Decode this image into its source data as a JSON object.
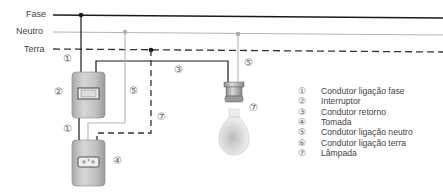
{
  "lines": {
    "fase": {
      "label": "Fase",
      "color": "#1a1a1a",
      "style": "solid"
    },
    "neutro": {
      "label": "Neutro",
      "color": "#b0b0b0",
      "style": "solid"
    },
    "terra": {
      "label": "Terra",
      "color": "#333333",
      "style": "dashed"
    }
  },
  "markers": {
    "m1_top": "①",
    "m2": "②",
    "m3": "③",
    "m5_left": "⑤",
    "m5_right": "⑤",
    "m7_left": "⑦",
    "m1_bottom": "①",
    "m4": "④",
    "m7_lamp": "⑦"
  },
  "components": {
    "switch": "Interruptor",
    "socket": "Tomada",
    "lamp": "Lâmpada"
  },
  "legend": [
    {
      "num": "①",
      "text": "Condutor ligação fase"
    },
    {
      "num": "②",
      "text": "Interruptor"
    },
    {
      "num": "③",
      "text": "Condutor retorno"
    },
    {
      "num": "④",
      "text": "Tomada"
    },
    {
      "num": "⑤",
      "text": "Condutor ligação neutro"
    },
    {
      "num": "⑥",
      "text": "Condutor ligação terra"
    },
    {
      "num": "⑦",
      "text": "Lâmpada"
    }
  ]
}
